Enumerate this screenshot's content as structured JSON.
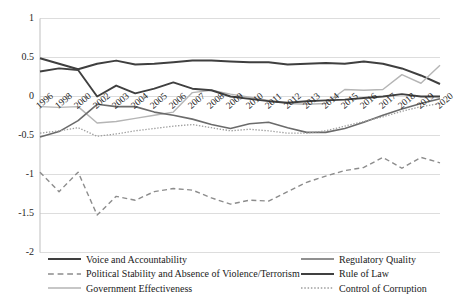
{
  "chart_data": {
    "type": "line",
    "title": "",
    "xlabel": "",
    "ylabel": "",
    "ylim": [
      -2,
      1
    ],
    "yticks": [
      "1",
      "0.5",
      "0",
      "-0.5",
      "-1",
      "-1.5",
      "-2"
    ],
    "ytick_values": [
      1,
      0.5,
      0,
      -0.5,
      -1,
      -1.5,
      -2
    ],
    "grid": true,
    "legend_position": "bottom",
    "categories": [
      "1996",
      "1998",
      "2000",
      "2002",
      "2003",
      "2004",
      "2005",
      "2006",
      "2007",
      "2008",
      "2009",
      "2010",
      "2011",
      "2012",
      "2013",
      "2014",
      "2015",
      "2016",
      "2017",
      "2018",
      "2019",
      "2020"
    ],
    "series": [
      {
        "name": "Voice and Accountability",
        "style": "solid",
        "color": "#3f3f3f",
        "width": 2.0,
        "values": [
          0.49,
          0.42,
          0.35,
          0.42,
          0.46,
          0.41,
          0.42,
          0.44,
          0.46,
          0.46,
          0.45,
          0.44,
          0.44,
          0.41,
          0.42,
          0.43,
          0.42,
          0.45,
          0.42,
          0.36,
          0.27,
          0.16
        ]
      },
      {
        "name": "Political Stability and Absence of Violence/Terrorism",
        "style": "dashed",
        "color": "#8c8c8c",
        "width": 1.4,
        "values": [
          -0.97,
          -1.22,
          -0.97,
          -1.52,
          -1.28,
          -1.33,
          -1.22,
          -1.18,
          -1.2,
          -1.3,
          -1.38,
          -1.33,
          -1.34,
          -1.22,
          -1.1,
          -1.02,
          -0.95,
          -0.91,
          -0.78,
          -0.92,
          -0.78,
          -0.85
        ]
      },
      {
        "name": "Government Effectiveness",
        "style": "solid",
        "color": "#b5b5b5",
        "width": 1.4,
        "values": [
          -0.13,
          -0.14,
          -0.13,
          -0.34,
          -0.32,
          -0.28,
          -0.24,
          -0.2,
          0.05,
          0.08,
          0.03,
          -0.01,
          -0.05,
          -0.09,
          -0.1,
          -0.09,
          0.09,
          0.08,
          0.09,
          0.28,
          0.17,
          0.4
        ]
      },
      {
        "name": "Regulatory Quality",
        "style": "solid",
        "color": "#6b6b6b",
        "width": 1.6,
        "values": [
          -0.52,
          -0.45,
          -0.31,
          -0.1,
          -0.13,
          -0.13,
          -0.2,
          -0.24,
          -0.29,
          -0.36,
          -0.41,
          -0.35,
          -0.33,
          -0.4,
          -0.46,
          -0.46,
          -0.41,
          -0.33,
          -0.24,
          -0.16,
          -0.09,
          -0.03
        ]
      },
      {
        "name": "Rule of Law",
        "style": "solid",
        "color": "#404040",
        "width": 1.9,
        "values": [
          0.32,
          0.36,
          0.34,
          0.0,
          0.14,
          0.04,
          0.1,
          0.18,
          0.1,
          0.08,
          0.0,
          -0.03,
          -0.06,
          -0.08,
          -0.06,
          -0.05,
          -0.04,
          -0.02,
          0.0,
          0.03,
          0.0,
          0.0
        ]
      },
      {
        "name": "Control of Corruption",
        "style": "dotted",
        "color": "#9e9e9e",
        "width": 1.3,
        "values": [
          -0.47,
          -0.44,
          -0.4,
          -0.51,
          -0.48,
          -0.44,
          -0.41,
          -0.38,
          -0.36,
          -0.4,
          -0.44,
          -0.42,
          -0.44,
          -0.47,
          -0.47,
          -0.44,
          -0.38,
          -0.32,
          -0.26,
          -0.19,
          -0.13,
          -0.09
        ]
      }
    ]
  },
  "legend": {
    "items": [
      {
        "label": "Voice and Accountability",
        "style": "solid",
        "color": "#3f3f3f",
        "width": 2.0
      },
      {
        "label": "Political Stability and Absence of Violence/Terrorism",
        "style": "dashed",
        "color": "#8c8c8c",
        "width": 1.6
      },
      {
        "label": "Government Effectiveness",
        "style": "solid",
        "color": "#b5b5b5",
        "width": 1.5
      },
      {
        "label": "Regulatory Quality",
        "style": "solid",
        "color": "#6b6b6b",
        "width": 1.6
      },
      {
        "label": "Rule of Law",
        "style": "solid",
        "color": "#404040",
        "width": 2.0
      },
      {
        "label": "Control of Corruption",
        "style": "dotted",
        "color": "#9e9e9e",
        "width": 1.4
      }
    ]
  },
  "colors": {
    "gridline": "#d9d9d9",
    "axis": "#bfbfbf",
    "text": "#262626",
    "background": "#ffffff"
  }
}
